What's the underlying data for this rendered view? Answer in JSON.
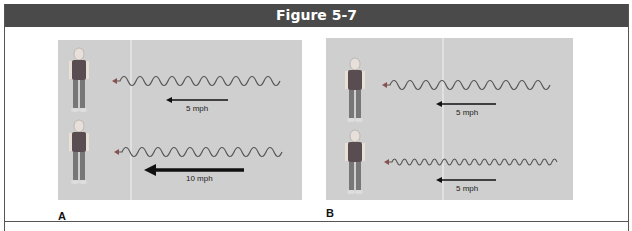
{
  "figure": {
    "title": "Figure 5-7",
    "header_color": "#4a4a4a",
    "panel_color": "#cfcfcf"
  },
  "panels": [
    {
      "label": "A",
      "rows": [
        {
          "speed": "5 mph",
          "wave_crests": 10,
          "arrow_weight": "thin"
        },
        {
          "speed": "10 mph",
          "wave_crests": 10,
          "arrow_weight": "thick"
        }
      ]
    },
    {
      "label": "B",
      "rows": [
        {
          "speed": "5 mph",
          "wave_crests": 10,
          "arrow_weight": "thin"
        },
        {
          "speed": "5 mph",
          "wave_crests": 17,
          "arrow_weight": "thin"
        }
      ]
    }
  ]
}
